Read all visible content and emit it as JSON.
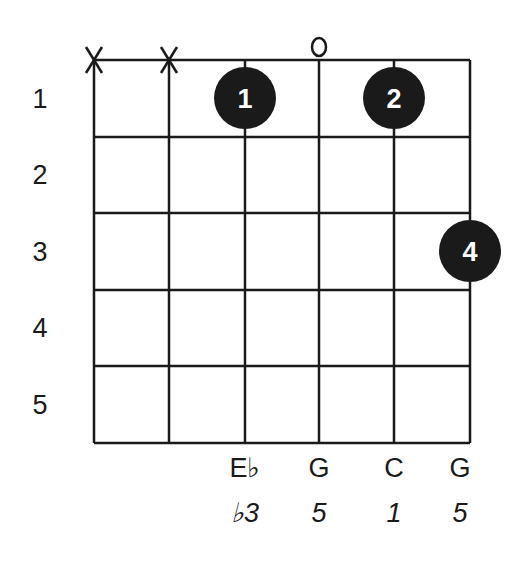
{
  "diagram": {
    "type": "guitar-chord-chart",
    "colors": {
      "line": "#1a1a1a",
      "dot": "#1a1a1a",
      "dot_text": "#ffffff",
      "background": "#ffffff"
    },
    "fret_numbers": [
      "1",
      "2",
      "3",
      "4",
      "5"
    ],
    "string_markers": [
      {
        "string": 6,
        "marker": "X"
      },
      {
        "string": 5,
        "marker": "X"
      },
      {
        "string": 4,
        "marker": ""
      },
      {
        "string": 3,
        "marker": "o"
      },
      {
        "string": 2,
        "marker": ""
      },
      {
        "string": 1,
        "marker": ""
      }
    ],
    "fingers": [
      {
        "string": 4,
        "fret": 1,
        "finger": "1"
      },
      {
        "string": 2,
        "fret": 1,
        "finger": "2"
      },
      {
        "string": 1,
        "fret": 3,
        "finger": "4"
      }
    ],
    "notes": [
      {
        "string": 4,
        "note": "E♭",
        "interval": "♭3"
      },
      {
        "string": 3,
        "note": "G",
        "interval": "5"
      },
      {
        "string": 2,
        "note": "C",
        "interval": "1"
      },
      {
        "string": 1,
        "note": "G",
        "interval": "5"
      }
    ]
  }
}
